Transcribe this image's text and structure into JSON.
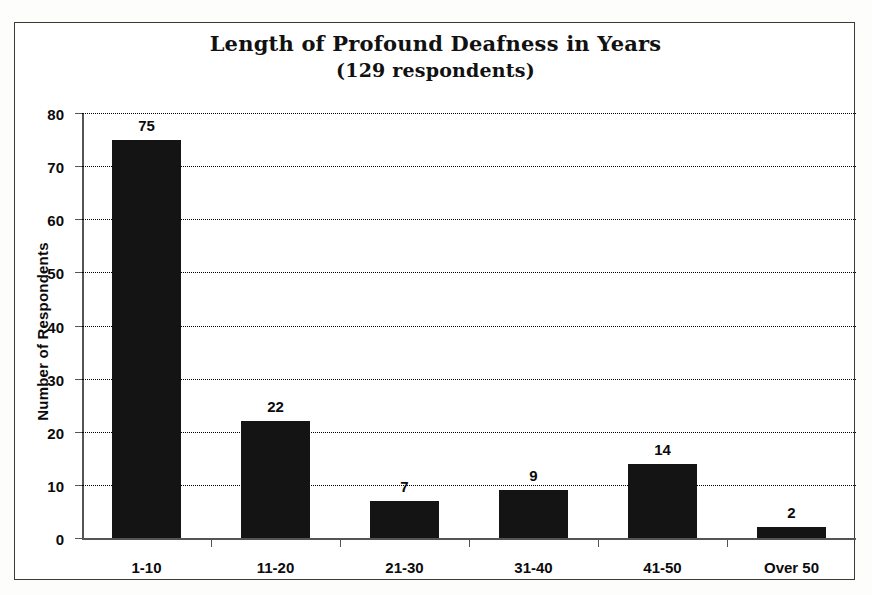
{
  "chart_data": {
    "type": "bar",
    "title": "Length of Profound Deafness in Years",
    "subtitle": "(129 respondents)",
    "categories": [
      "1-10",
      "11-20",
      "21-30",
      "31-40",
      "41-50",
      "Over 50"
    ],
    "values": [
      75,
      22,
      7,
      9,
      14,
      2
    ],
    "data_labels": [
      "75",
      "22",
      "7",
      "9",
      "14",
      "2"
    ],
    "xlabel": "",
    "ylabel": "Number of Respondents",
    "ylim": [
      0,
      80
    ],
    "ytick_step": 10,
    "ytick_labels": [
      "80",
      "70",
      "60",
      "50",
      "40",
      "30",
      "20",
      "10",
      "0"
    ],
    "ytick_values": [
      80,
      70,
      60,
      50,
      40,
      30,
      20,
      10,
      0
    ],
    "grid": "horizontal-dotted",
    "legend": "none",
    "bar_color": "#141414",
    "background_color": "#ffffff",
    "frame_color": "#3a3a3a",
    "axis_color": "#555555"
  }
}
